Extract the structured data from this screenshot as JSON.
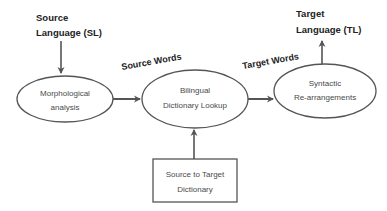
{
  "diagram": {
    "input": {
      "line1": "Source",
      "line2": "Language (SL)"
    },
    "output": {
      "line1": "Target",
      "line2": "Language (TL)"
    },
    "nodes": [
      {
        "id": "morph",
        "shape": "ellipse",
        "line1": "Morphological",
        "line2": "analysis"
      },
      {
        "id": "lookup",
        "shape": "ellipse",
        "line1": "Bilingual",
        "line2": "Dictionary Lookup"
      },
      {
        "id": "syntax",
        "shape": "ellipse",
        "line1": "Syntactic",
        "line2": "Re-arrangements"
      },
      {
        "id": "dict",
        "shape": "rectangle",
        "line1": "Source to Target",
        "line2": "Dictionary"
      }
    ],
    "edges": [
      {
        "from": "input",
        "to": "morph",
        "label": ""
      },
      {
        "from": "morph",
        "to": "lookup",
        "label": "Source Words"
      },
      {
        "from": "lookup",
        "to": "syntax",
        "label": "Target Words"
      },
      {
        "from": "dict",
        "to": "lookup",
        "label": ""
      },
      {
        "from": "syntax",
        "to": "output",
        "label": ""
      }
    ],
    "colors": {
      "stroke": "#555555",
      "text": "#222222",
      "node_text": "#4a4a4a",
      "background": "#ffffff"
    }
  }
}
